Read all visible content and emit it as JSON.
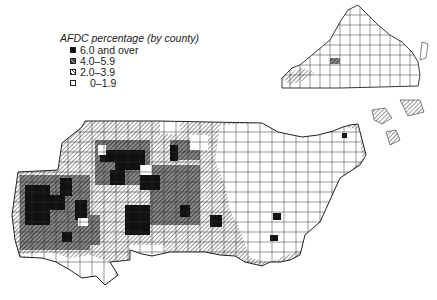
{
  "legend": {
    "title": "AFDC percentage (by county)",
    "items": [
      {
        "label": "6.0 and over",
        "fill": "dark"
      },
      {
        "label": "4.0–5.9",
        "fill": "mid"
      },
      {
        "label": "2.0–3.9",
        "fill": "hatch"
      },
      {
        "label": "0–1.9",
        "fill": "white"
      }
    ]
  },
  "map": {
    "regions": [
      "main-south-region",
      "virginia-inset"
    ],
    "colors": {
      "dark": "#111111",
      "mid": "#6a6a6a",
      "hatch": "#b5b5b5",
      "white": "#ffffff",
      "border": "#333333"
    }
  }
}
